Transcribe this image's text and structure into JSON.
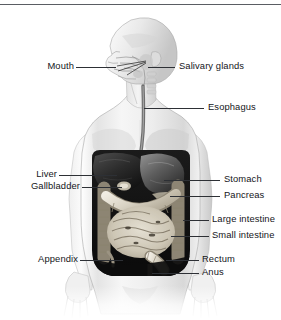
{
  "figure": {
    "background_color": "#ffffff",
    "text_color": "#14161a",
    "leader_line_color": "#2d3035",
    "width": 281,
    "height": 320
  },
  "labels": {
    "mouth": "Mouth",
    "salivary_glands": "Salivary glands",
    "esophagus": "Esophagus",
    "liver": "Liver",
    "gallbladder": "Gallbladder",
    "stomach": "Stomach",
    "pancreas": "Pancreas",
    "large_intestine": "Large intestine",
    "small_intestine": "Small intestine",
    "appendix": "Appendix",
    "rectum": "Rectum",
    "anus": "Anus"
  }
}
